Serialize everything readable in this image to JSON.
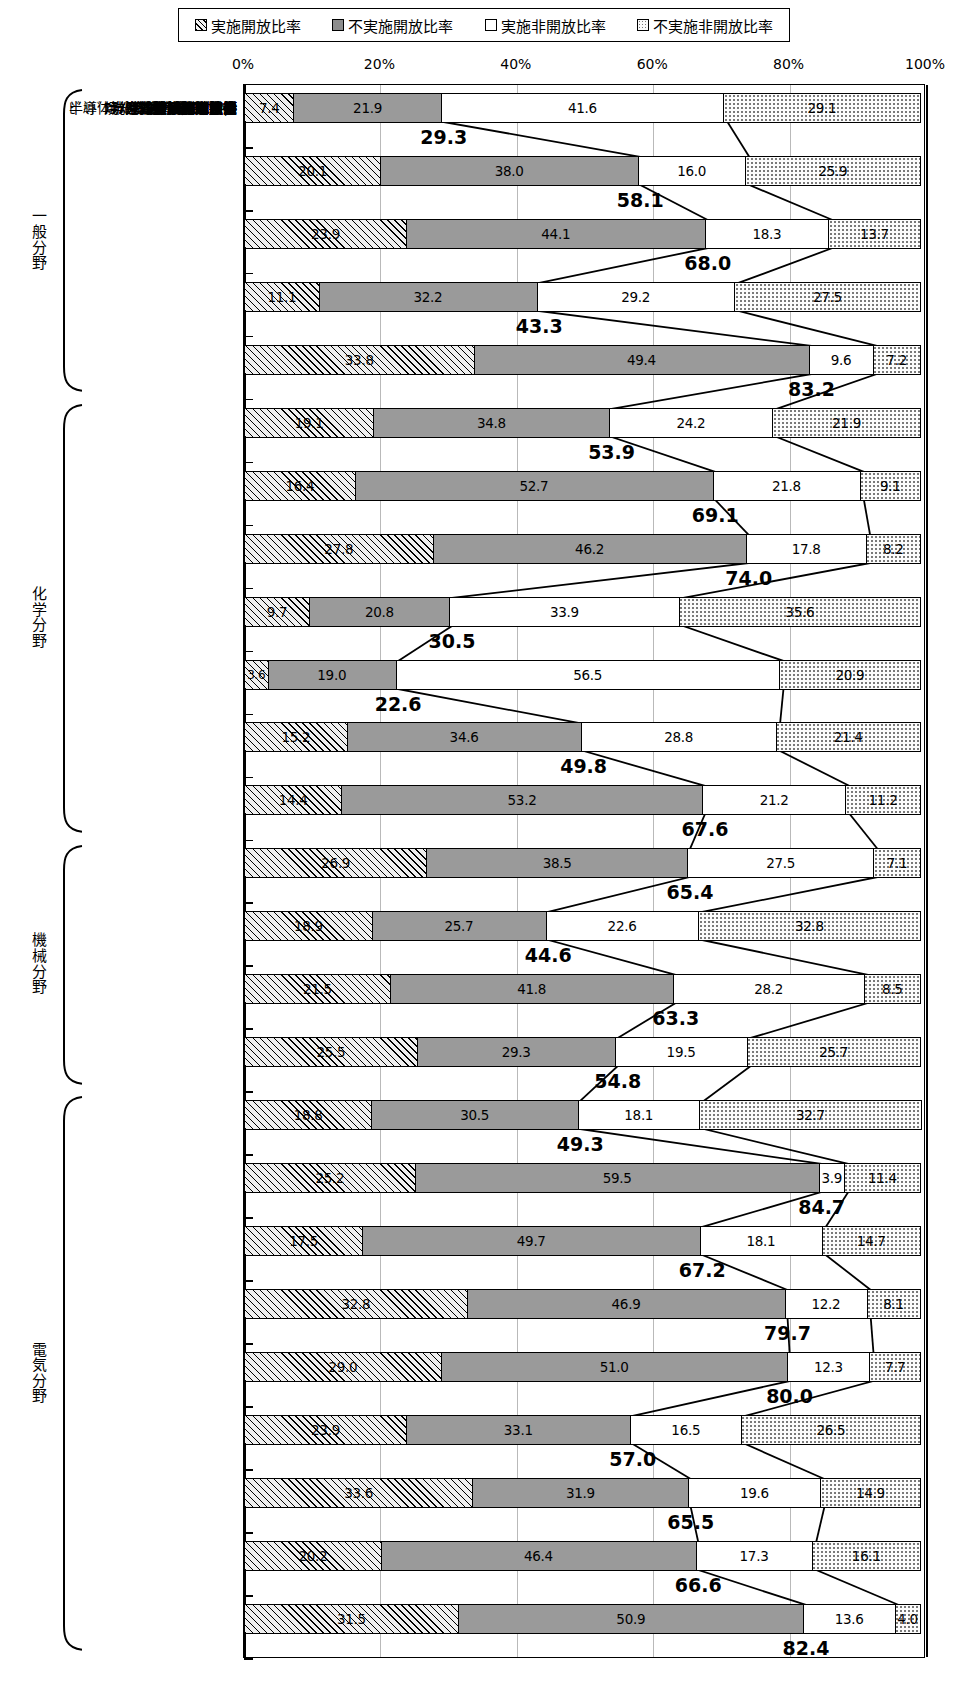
{
  "legend": {
    "items": [
      {
        "key": "s1",
        "label": "実施開放比率",
        "pattern": "hatch-diagonal"
      },
      {
        "key": "s2",
        "label": "不実施開放比率",
        "pattern": "solid-grey"
      },
      {
        "key": "s3",
        "label": "実施非開放比率",
        "pattern": "white"
      },
      {
        "key": "s4",
        "label": "不実施非開放比率",
        "pattern": "dotted"
      }
    ]
  },
  "axis": {
    "ticks": [
      "0%",
      "20%",
      "40%",
      "60%",
      "80%",
      "100%"
    ],
    "values": [
      0,
      20,
      40,
      60,
      80,
      100
    ],
    "min": 0,
    "max": 100
  },
  "groups": [
    {
      "label": "一般分野",
      "rows": [
        0,
        1,
        2,
        3,
        4
      ]
    },
    {
      "label": "化学分野",
      "rows": [
        5,
        6,
        7,
        8,
        9,
        10,
        11
      ]
    },
    {
      "label": "機械分野",
      "rows": [
        12,
        13,
        14,
        15
      ]
    },
    {
      "label": "電気分野",
      "rows": [
        16,
        17,
        18,
        19,
        20,
        21,
        22,
        23,
        24
      ]
    }
  ],
  "chart_data": {
    "type": "bar",
    "orientation": "horizontal",
    "stacked": true,
    "stack_total": 100,
    "title": "",
    "xlabel": "",
    "ylabel": "",
    "xlim": [
      0,
      100
    ],
    "grid": true,
    "legend_position": "top",
    "series": [
      {
        "name": "実施開放比率",
        "key": "s1",
        "values": [
          7.4,
          20.1,
          23.9,
          11.1,
          33.8,
          19.1,
          16.4,
          27.8,
          9.7,
          3.6,
          15.2,
          14.4,
          26.9,
          18.9,
          21.5,
          25.5,
          18.8,
          25.2,
          17.5,
          32.8,
          29.0,
          23.9,
          33.6,
          20.2,
          31.5
        ]
      },
      {
        "name": "不実施開放比率",
        "key": "s2",
        "values": [
          21.9,
          38.0,
          44.1,
          32.2,
          49.4,
          34.8,
          52.7,
          46.2,
          20.8,
          19.0,
          34.6,
          53.2,
          38.5,
          25.7,
          41.8,
          29.3,
          30.5,
          59.5,
          49.7,
          46.9,
          51.0,
          33.1,
          31.9,
          46.4,
          50.9
        ]
      },
      {
        "name": "実施非開放比率",
        "key": "s3",
        "values": [
          41.6,
          16.0,
          18.3,
          29.2,
          9.6,
          24.2,
          21.8,
          17.8,
          33.9,
          56.5,
          28.8,
          21.2,
          27.5,
          22.6,
          28.2,
          19.5,
          18.1,
          3.9,
          18.1,
          12.2,
          12.3,
          16.5,
          19.6,
          17.3,
          13.6
        ]
      },
      {
        "name": "不実施非開放比率",
        "key": "s4",
        "values": [
          29.1,
          25.9,
          13.7,
          27.5,
          7.2,
          21.9,
          9.1,
          8.2,
          35.6,
          20.9,
          21.4,
          11.2,
          7.1,
          32.8,
          8.5,
          25.7,
          32.7,
          11.4,
          14.7,
          8.1,
          7.7,
          26.5,
          14.9,
          16.1,
          4.0
        ]
      }
    ],
    "categories": [
      "ｶｰﾃﾝｳｫｰﾙ",
      "気体膜分離装置",
      "半導体洗浄と環境適応技術",
      "焼却炉排ｶﾞｽ処理技術",
      "はんだ付け鉛ﾌﾘｰ技術",
      "ﾌﾟﾗｽﾃｨｯｸﾘｻｲｸﾙ",
      "ﾊﾞｲｵｾﾝｻ",
      "ｾﾗﾐｯｸｽの接合",
      "有機EL素子",
      "生分解ﾎﾟﾘｴｽﾃﾙ",
      "有機導電性ﾎﾟﾘﾏｰ",
      "ﾘﾁｳﾑﾎﾟﾘﾏｰ電池",
      "車いす",
      "金属射出成形技術",
      "微細ﾚｰｻﾞ加工",
      "ﾋｰﾄﾊﾟｲﾌﾟ",
      "圧力ｾﾝｻ",
      "個人照合",
      "非接触型ICｶｰﾄﾞ",
      "ﾋﾞﾙﾄﾞｱｯﾌﾟ多層ﾌﾟﾘﾝﾄ配線板",
      "携帯電話表示技術",
      "ｱｸﾃｨﾌﾞ液晶駆動技術",
      "ﾌﾟﾛｸﾞﾗﾑ制御技術",
      "半導体ﾚｰｻﾞの活性層",
      "無線LAN"
    ],
    "totals_label_name": "開放比率合計 (実施開放+不実施開放)",
    "totals": [
      29.3,
      58.1,
      68.0,
      43.3,
      83.2,
      53.9,
      69.1,
      74.0,
      30.5,
      22.6,
      49.8,
      67.6,
      65.4,
      44.6,
      63.3,
      54.8,
      49.3,
      84.7,
      67.2,
      79.7,
      80.0,
      57.0,
      65.5,
      66.6,
      82.4
    ]
  },
  "colors": {
    "outline": "#000000",
    "grid": "#b9b9b9",
    "series2_fill": "#9a9a9a",
    "background": "#ffffff"
  }
}
